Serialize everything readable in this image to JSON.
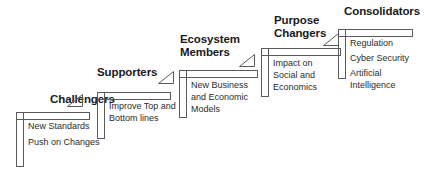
{
  "diagram": {
    "title_color": "#1a1a1a",
    "body_color": "#2b2b2b",
    "line_color": "#5a5a5a",
    "background": "#ffffff",
    "steps": [
      {
        "title": "Challengers",
        "icon": "right-triangle-icon",
        "items": [
          "New Standards",
          "Push on Changes"
        ]
      },
      {
        "title": "Supporters",
        "icon": "right-triangle-icon",
        "items": [
          "Improve Top and\nBottom lines"
        ]
      },
      {
        "title": "Ecosystem\nMembers",
        "icon": "right-triangle-icon",
        "items": [
          "New Business\nand Economic\nModels"
        ]
      },
      {
        "title": "Purpose\nChangers",
        "icon": "right-triangle-icon",
        "items": [
          "Impact on\nSocial and\nEconomics"
        ]
      },
      {
        "title": "Consolidators",
        "icon": "right-triangle-icon",
        "items": [
          "Regulation",
          "Cyber Security",
          "Artificial\nIntelligence"
        ]
      }
    ]
  }
}
